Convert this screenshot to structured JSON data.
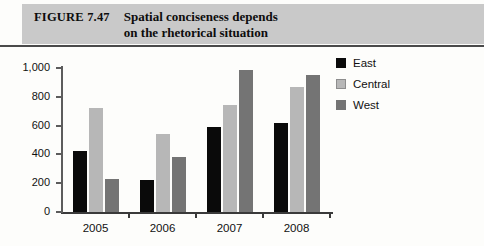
{
  "figure": {
    "label": "FIGURE 7.47",
    "title_line1": "Spatial conciseness depends",
    "title_line2": "on the rhetorical situation",
    "banner_color": "#c9c9c9",
    "rule_color": "#4a4a4a"
  },
  "legend": {
    "position": "right",
    "entries": [
      {
        "label": "East",
        "color": "#0a0a0a"
      },
      {
        "label": "Central",
        "color": "#b7b7b7"
      },
      {
        "label": "West",
        "color": "#747474"
      }
    ]
  },
  "axis": {
    "y_ticks": [
      "0",
      "200",
      "400",
      "600",
      "800",
      "1,000"
    ],
    "x_ticks": [
      "2005",
      "2006",
      "2007",
      "2008"
    ]
  },
  "chart_data": {
    "type": "bar",
    "title": "Spatial conciseness depends on the rhetorical situation",
    "subtitle": "",
    "xlabel": "",
    "ylabel": "",
    "categories": [
      "2005",
      "2006",
      "2007",
      "2008"
    ],
    "series": [
      {
        "name": "East",
        "color": "#0a0a0a",
        "values": [
          425,
          220,
          590,
          615
        ]
      },
      {
        "name": "Central",
        "color": "#b7b7b7",
        "values": [
          725,
          540,
          740,
          870
        ]
      },
      {
        "name": "West",
        "color": "#747474",
        "values": [
          230,
          380,
          985,
          950
        ]
      }
    ],
    "ylim": [
      0,
      1000
    ],
    "ytick_values": [
      0,
      200,
      400,
      600,
      800,
      1000
    ],
    "ytick_labels": [
      "0",
      "200",
      "400",
      "600",
      "800",
      "1,000"
    ],
    "grid": false,
    "legend_position": "right"
  }
}
